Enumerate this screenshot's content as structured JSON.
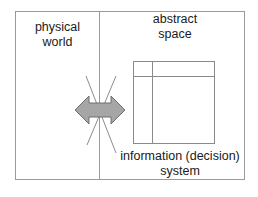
{
  "diagram": {
    "left_region": {
      "label_line1": "physical",
      "label_line2": "world"
    },
    "right_region": {
      "label_line1": "abstract",
      "label_line2": "space"
    },
    "system": {
      "label_line1": "information (decision)",
      "label_line2": "system"
    },
    "colors": {
      "border": "#9a9a9a",
      "arrow_fill": "#a6a6a6",
      "arrow_stroke": "#6e6e6e",
      "cross_lines": "#8c8c8c",
      "text": "#1a1a1a"
    }
  }
}
